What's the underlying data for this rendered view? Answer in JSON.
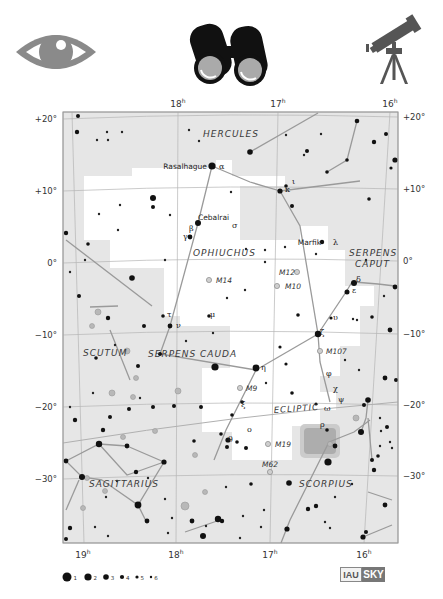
{
  "icons": [
    {
      "name": "naked-eye-icon",
      "label": "eye"
    },
    {
      "name": "binoculars-icon",
      "label": "binoculars"
    },
    {
      "name": "telescope-icon",
      "label": "telescope"
    }
  ],
  "map": {
    "frame": {
      "x": 63,
      "y": 112,
      "w": 335,
      "h": 431
    },
    "colors": {
      "background": "#e6e6e6",
      "constellation_area": "#ffffff",
      "lines": "#9a9a9a",
      "stars": "#111111",
      "dso": "#a8a8a8",
      "grid": "#b5b5b5"
    },
    "ra_labels_top": [
      {
        "text": "18",
        "sup": "h",
        "x": 178
      },
      {
        "text": "17",
        "sup": "h",
        "x": 278
      },
      {
        "text": "16",
        "sup": "h",
        "x": 390
      }
    ],
    "ra_labels_bottom": [
      {
        "text": "19",
        "sup": "h",
        "x": 83
      },
      {
        "text": "18",
        "sup": "h",
        "x": 176
      },
      {
        "text": "17",
        "sup": "h",
        "x": 270
      },
      {
        "text": "16",
        "sup": "h",
        "x": 364
      }
    ],
    "dec_labels_left": [
      {
        "text": "+20°",
        "y": 122
      },
      {
        "text": "+10°",
        "y": 194
      },
      {
        "text": "0°",
        "y": 266
      },
      {
        "text": "−10°",
        "y": 338
      },
      {
        "text": "−20°",
        "y": 410
      },
      {
        "text": "−30°",
        "y": 482
      }
    ],
    "dec_labels_right": [
      {
        "text": "+20°",
        "y": 120
      },
      {
        "text": "+10°",
        "y": 192
      },
      {
        "text": "0°",
        "y": 264
      },
      {
        "text": "−10°",
        "y": 337
      },
      {
        "text": "−20°",
        "y": 408
      },
      {
        "text": "−30°",
        "y": 479
      }
    ],
    "constellations": [
      {
        "name": "HERCULES",
        "x": 203,
        "y": 137
      },
      {
        "name": "OPHIUCHUS",
        "x": 193,
        "y": 256
      },
      {
        "name": "SERPENS",
        "x": 349,
        "y": 256
      },
      {
        "name": "CAPUT",
        "x": 355,
        "y": 267
      },
      {
        "name": "SCUTUM",
        "x": 83,
        "y": 356
      },
      {
        "name": "SERPENS CAUDA",
        "x": 148,
        "y": 357
      },
      {
        "name": "SAGITTARIUS",
        "x": 89,
        "y": 487
      },
      {
        "name": "SCORPIUS",
        "x": 299,
        "y": 487
      }
    ],
    "ecliptic_label": {
      "text": "ECLIPTIC",
      "x": 274,
      "y": 413
    },
    "named_stars": [
      {
        "name": "Rasalhague",
        "greek": "α",
        "x": 213,
        "y": 166
      },
      {
        "name": "Cebalrai",
        "greek": "β",
        "x": 198,
        "y": 224
      },
      {
        "name": "Marfik",
        "greek": "λ",
        "x": 327,
        "y": 242
      }
    ],
    "greek_labels": [
      {
        "t": "γ",
        "x": 183,
        "y": 239
      },
      {
        "t": "σ",
        "x": 232,
        "y": 228
      },
      {
        "t": "ι",
        "x": 292,
        "y": 184
      },
      {
        "t": "κ",
        "x": 285,
        "y": 192
      },
      {
        "t": "δ",
        "x": 356,
        "y": 282
      },
      {
        "t": "ε",
        "x": 352,
        "y": 293
      },
      {
        "t": "υ",
        "x": 333,
        "y": 320
      },
      {
        "t": "ζ",
        "x": 320,
        "y": 335
      },
      {
        "t": "τ",
        "x": 167,
        "y": 317
      },
      {
        "t": "μ",
        "x": 210,
        "y": 317
      },
      {
        "t": "ν",
        "x": 176,
        "y": 328
      },
      {
        "t": "η",
        "x": 261,
        "y": 370
      },
      {
        "t": "φ",
        "x": 326,
        "y": 376
      },
      {
        "t": "χ",
        "x": 333,
        "y": 391
      },
      {
        "t": "ψ",
        "x": 338,
        "y": 402
      },
      {
        "t": "ξ",
        "x": 241,
        "y": 407
      },
      {
        "t": "ω",
        "x": 324,
        "y": 411
      },
      {
        "t": "ρ",
        "x": 320,
        "y": 427
      },
      {
        "t": "ο",
        "x": 247,
        "y": 432
      },
      {
        "t": "θ",
        "x": 228,
        "y": 442
      }
    ],
    "messier": [
      {
        "id": "M14",
        "x": 209,
        "y": 280,
        "lx": 216
      },
      {
        "id": "M12",
        "x": 297,
        "y": 272,
        "lx": 279,
        "left": true
      },
      {
        "id": "M10",
        "x": 277,
        "y": 286,
        "lx": 285
      },
      {
        "id": "M107",
        "x": 320,
        "y": 351,
        "lx": 326
      },
      {
        "id": "M9",
        "x": 240,
        "y": 388,
        "lx": 246
      },
      {
        "id": "M19",
        "x": 268,
        "y": 444,
        "lx": 275
      },
      {
        "id": "M62",
        "x": 270,
        "y": 472,
        "lx": 262,
        "above": true
      }
    ]
  },
  "legend": {
    "magnitudes": [
      "1",
      "2",
      "3",
      "4",
      "5",
      "6"
    ]
  },
  "logo": {
    "left": "IAU",
    "right": "SKY"
  }
}
